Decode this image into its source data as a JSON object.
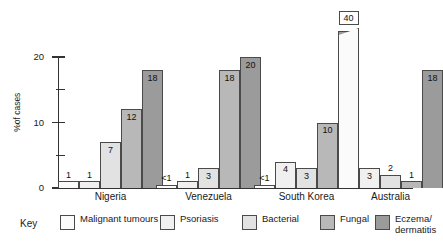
{
  "chart_data": {
    "type": "bar",
    "title": "",
    "xlabel": "",
    "ylabel": "%of cases",
    "ylim": [
      0,
      22
    ],
    "yticks": [
      0,
      5,
      10,
      15,
      20
    ],
    "ytick_labels": [
      "0",
      "",
      "10",
      "",
      "20"
    ],
    "grid": false,
    "legend_position": "bottom",
    "legend_title": "Key",
    "categories": [
      "Nigeria",
      "Venezuela",
      "South Korea",
      "Australia"
    ],
    "series": [
      {
        "name": "Malignant tumours",
        "color": "#fbfbfb",
        "values": [
          1,
          0.5,
          0.5,
          40
        ],
        "labels": [
          "1",
          "<1",
          "<1",
          "40"
        ],
        "broken_axis": [
          false,
          false,
          false,
          true
        ]
      },
      {
        "name": "Psoriasis",
        "color": "#f0f0f0",
        "values": [
          1,
          1,
          4,
          3
        ],
        "labels": [
          "1",
          "1",
          "4",
          "3"
        ],
        "broken_axis": [
          false,
          false,
          false,
          false
        ]
      },
      {
        "name": "Bacterial",
        "color": "#e2e2e2",
        "values": [
          7,
          3,
          3,
          2
        ],
        "labels": [
          "7",
          "3",
          "3",
          "2"
        ],
        "broken_axis": [
          false,
          false,
          false,
          false
        ]
      },
      {
        "name": "Fungal",
        "color": "#b8b8b8",
        "values": [
          12,
          18,
          10,
          1
        ],
        "labels": [
          "12",
          "18",
          "10",
          "1"
        ],
        "broken_axis": [
          false,
          false,
          false,
          false
        ]
      },
      {
        "name": "Eczema/\ndermatitis",
        "color": "#9b9b9b",
        "values": [
          18,
          20,
          24,
          18
        ],
        "labels": [
          "18",
          "20",
          "24",
          "18"
        ],
        "broken_axis": [
          false,
          false,
          false,
          false
        ]
      }
    ]
  }
}
